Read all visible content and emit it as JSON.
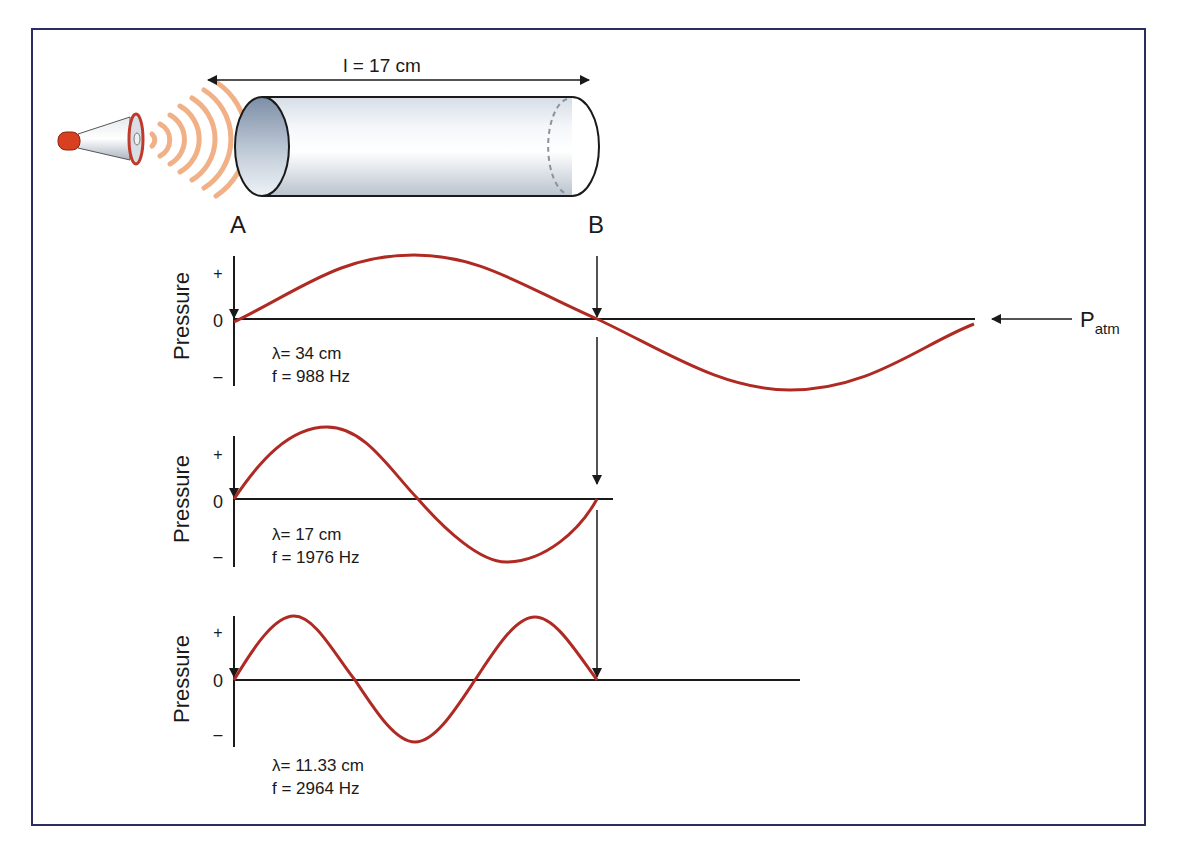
{
  "figure": {
    "frame_color": "#2b2d5e",
    "wave_color": "#b02a24",
    "sound_ring_color": "#f0a878",
    "tube": {
      "length_label": "l = 17 cm",
      "end_a_label": "A",
      "end_b_label": "B"
    },
    "atm_label": {
      "main": "P",
      "sub": "atm"
    },
    "panels": [
      {
        "axis_label": "Pressure",
        "tick_plus": "+",
        "tick_zero": "0",
        "tick_minus": "–",
        "wavelength_label": "λ= 34 cm",
        "frequency_label": "f = 988 Hz",
        "mode": "fundamental (half wavelength in tube)"
      },
      {
        "axis_label": "Pressure",
        "tick_plus": "+",
        "tick_zero": "0",
        "tick_minus": "–",
        "wavelength_label": "λ= 17 cm",
        "frequency_label": "f = 1976 Hz",
        "mode": "second harmonic (one wavelength in tube)"
      },
      {
        "axis_label": "Pressure",
        "tick_plus": "+",
        "tick_zero": "0",
        "tick_minus": "–",
        "wavelength_label": "λ= 11.33 cm",
        "frequency_label": "f = 2964 Hz",
        "mode": "third harmonic (1.5 wavelengths in tube)"
      }
    ]
  }
}
